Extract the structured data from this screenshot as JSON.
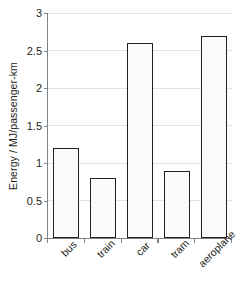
{
  "chart_data": {
    "type": "bar",
    "title": "",
    "subtitle": "",
    "xlabel": "",
    "ylabel": "Energy / MJ/passenger-km",
    "categories": [
      "bus",
      "train",
      "car",
      "tram",
      "aeroplane"
    ],
    "values": [
      1.2,
      0.8,
      2.6,
      0.9,
      2.7
    ],
    "ylim": [
      0,
      3
    ],
    "ytick_labels": [
      "0",
      "0.5",
      "1",
      "1.5",
      "2",
      "2.5",
      "3"
    ],
    "ytick_values": [
      0,
      0.5,
      1,
      1.5,
      2,
      2.5,
      3
    ],
    "grid": "horizontal",
    "legend": "none",
    "annotations": [],
    "colors": {
      "bar_fill": "#fbfbfb",
      "bar_edge": "#231f20",
      "grid": "#e3e3e4",
      "axis": "#808285",
      "text": "#231f20",
      "background": "#ffffff"
    }
  }
}
